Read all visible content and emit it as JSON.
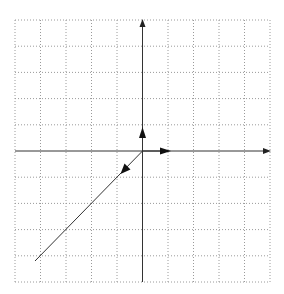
{
  "diagram": {
    "type": "vector-plot",
    "grid": {
      "cells_x": 10,
      "cells_y": 10,
      "style": "dotted",
      "color": "#9a9a9a"
    },
    "axes": {
      "color": "#333333",
      "x_range": [
        -5,
        5
      ],
      "y_range": [
        -5,
        5
      ]
    },
    "vectors": [
      {
        "name": "unit-vector-x",
        "from": [
          0,
          0
        ],
        "to": [
          1,
          0
        ],
        "arrow_at": [
          1,
          0
        ]
      },
      {
        "name": "unit-vector-y",
        "from": [
          0,
          0
        ],
        "to": [
          0,
          1
        ],
        "arrow_at": [
          0,
          1
        ]
      },
      {
        "name": "diagonal-line",
        "from": [
          0,
          0
        ],
        "to": [
          -4.2,
          -4.2
        ],
        "arrow_at": [
          -0.85,
          -0.85
        ]
      }
    ]
  }
}
